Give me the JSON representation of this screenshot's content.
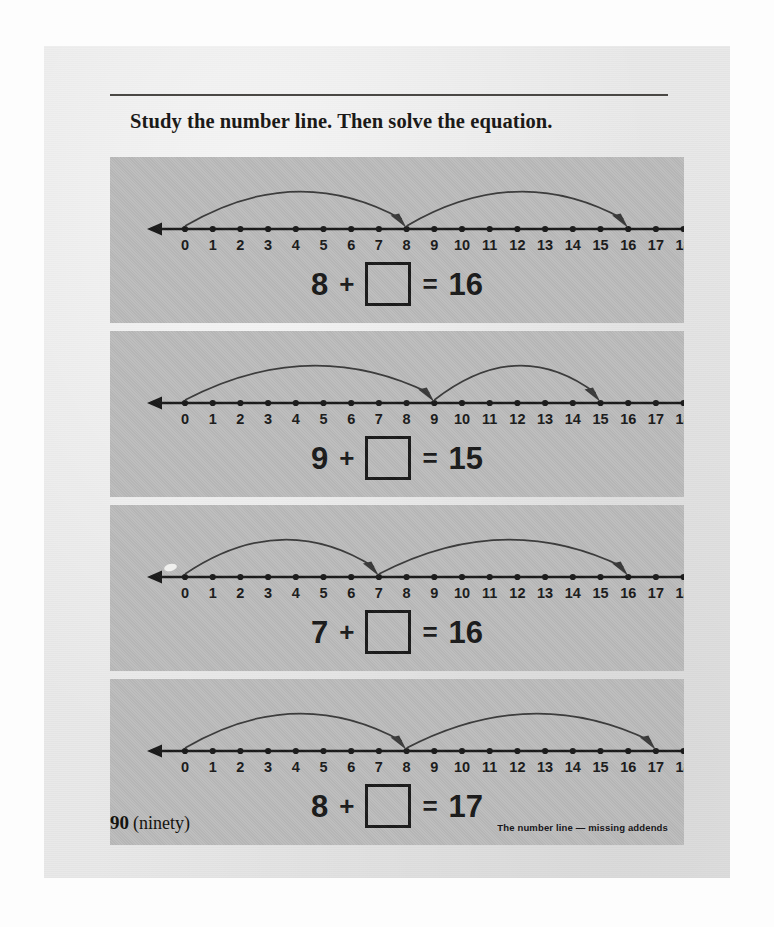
{
  "page": {
    "instruction": "Study the number line.  Then solve the equation.",
    "page_number": "90",
    "page_number_word": "(ninety)",
    "caption": "The number line — missing addends",
    "paper_color": "#e9e9e9",
    "panel_color": "#bcbcbc",
    "ink_color": "#1a1a1a"
  },
  "numberline": {
    "min": 0,
    "max": 18,
    "tick_labels": [
      "0",
      "1",
      "2",
      "3",
      "4",
      "5",
      "6",
      "7",
      "8",
      "9",
      "10",
      "11",
      "12",
      "13",
      "14",
      "15",
      "16",
      "17",
      "18"
    ]
  },
  "exercises": [
    {
      "id": "exercise-1",
      "arc1": {
        "from": 0,
        "to": 8
      },
      "arc2": {
        "from": 8,
        "to": 16
      },
      "addend": "8",
      "plus": "+",
      "equals": "=",
      "sum": "16",
      "answer_box": ""
    },
    {
      "id": "exercise-2",
      "arc1": {
        "from": 0,
        "to": 9
      },
      "arc2": {
        "from": 9,
        "to": 15
      },
      "addend": "9",
      "plus": "+",
      "equals": "=",
      "sum": "15",
      "answer_box": ""
    },
    {
      "id": "exercise-3",
      "arc1": {
        "from": 0,
        "to": 7
      },
      "arc2": {
        "from": 7,
        "to": 16
      },
      "addend": "7",
      "plus": "+",
      "equals": "=",
      "sum": "16",
      "answer_box": ""
    },
    {
      "id": "exercise-4",
      "arc1": {
        "from": 0,
        "to": 8
      },
      "arc2": {
        "from": 8,
        "to": 17
      },
      "addend": "8",
      "plus": "+",
      "equals": "=",
      "sum": "17",
      "answer_box": ""
    }
  ]
}
